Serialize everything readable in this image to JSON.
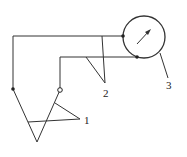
{
  "diagram": {
    "labels": {
      "thermocouple_1": "1",
      "thermocouple_2": "2",
      "meter": "3"
    },
    "colors": {
      "line": "#333333",
      "background": "#ffffff"
    },
    "components": [
      {
        "id": "1",
        "name": "measuring thermocouple junction"
      },
      {
        "id": "2",
        "name": "reference thermocouple junction"
      },
      {
        "id": "3",
        "name": "galvanometer / meter"
      }
    ]
  }
}
